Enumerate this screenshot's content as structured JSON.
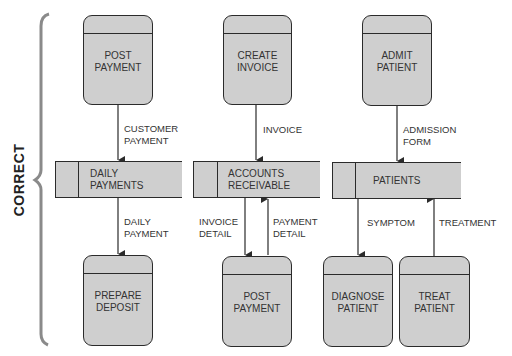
{
  "side_label": "CORRECT",
  "colors": {
    "box_fill": "#cfcfcf",
    "stroke": "#2b2b2b",
    "bracket": "#8a8a8a"
  },
  "columns": [
    {
      "source_process": "POST\nPAYMENT",
      "input_flow": "CUSTOMER\nPAYMENT",
      "data_store": "DAILY\nPAYMENTS",
      "output_flows": [
        "DAILY\nPAYMENT"
      ],
      "target_processes": [
        "PREPARE\nDEPOSIT"
      ]
    },
    {
      "source_process": "CREATE\nINVOICE",
      "input_flow": "INVOICE",
      "data_store": "ACCOUNTS\nRECEIVABLE",
      "output_flows": [
        "INVOICE\nDETAIL",
        "PAYMENT\nDETAIL"
      ],
      "target_processes": [
        "POST\nPAYMENT"
      ]
    },
    {
      "source_process": "ADMIT\nPATIENT",
      "input_flow": "ADMISSION\nFORM",
      "data_store": "PATIENTS",
      "output_flows": [
        "SYMPTOM",
        "TREATMENT"
      ],
      "target_processes": [
        "DIAGNOSE\nPATIENT",
        "TREAT\nPATIENT"
      ]
    }
  ]
}
